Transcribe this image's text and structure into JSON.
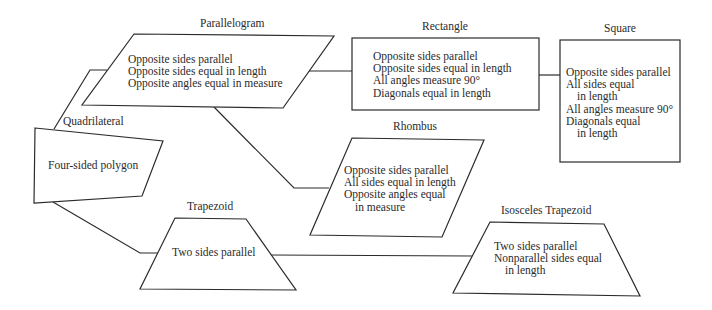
{
  "diagram": {
    "nodes": {
      "quadrilateral": {
        "title": "Quadrilateral",
        "lines": [
          "Four-sided polygon"
        ]
      },
      "parallelogram": {
        "title": "Parallelogram",
        "lines": [
          "Opposite sides parallel",
          "Opposite sides equal in length",
          "Opposite angles equal in measure"
        ]
      },
      "rectangle": {
        "title": "Rectangle",
        "lines": [
          "Opposite sides parallel",
          "Opposite sides equal in length",
          "All angles measure 90°",
          "Diagonals equal in length"
        ]
      },
      "square": {
        "title": "Square",
        "lines": [
          "Opposite sides parallel",
          "All sides equal",
          "in length",
          "All angles measure 90°",
          "Diagonals equal",
          "in length"
        ]
      },
      "rhombus": {
        "title": "Rhombus",
        "lines": [
          "Opposite sides parallel",
          "All sides equal in length",
          "Opposite angles equal",
          "in measure"
        ]
      },
      "trapezoid": {
        "title": "Trapezoid",
        "lines": [
          "Two sides parallel"
        ]
      },
      "isosceles_trapezoid": {
        "title": "Isosceles Trapezoid",
        "lines": [
          "Two sides parallel",
          "Nonparallel sides equal",
          "in length"
        ]
      }
    },
    "edges": [
      {
        "from": "Quadrilateral",
        "to": "Parallelogram"
      },
      {
        "from": "Quadrilateral",
        "to": "Trapezoid"
      },
      {
        "from": "Parallelogram",
        "to": "Rectangle"
      },
      {
        "from": "Parallelogram",
        "to": "Rhombus"
      },
      {
        "from": "Rectangle",
        "to": "Square"
      },
      {
        "from": "Trapezoid",
        "to": "Isosceles Trapezoid"
      }
    ],
    "colors": {
      "stroke": "#2b2b2b",
      "background": "#ffffff",
      "text": "#2b2b2b"
    }
  }
}
